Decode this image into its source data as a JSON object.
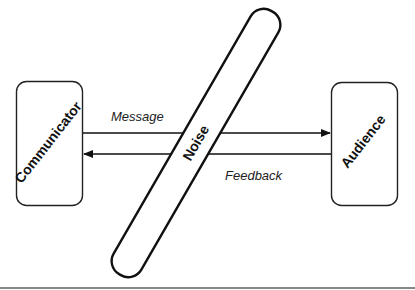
{
  "diagram": {
    "nodes": [
      {
        "id": "communicator",
        "label": "Communicator"
      },
      {
        "id": "audience",
        "label": "Audience"
      },
      {
        "id": "noise",
        "label": "Noise"
      }
    ],
    "edges": [
      {
        "from": "communicator",
        "to": "audience",
        "label": "Message"
      },
      {
        "from": "audience",
        "to": "communicator",
        "label": "Feedback"
      }
    ]
  },
  "colors": {
    "stroke": "#111111",
    "background": "#ffffff",
    "rule": "#777777"
  }
}
